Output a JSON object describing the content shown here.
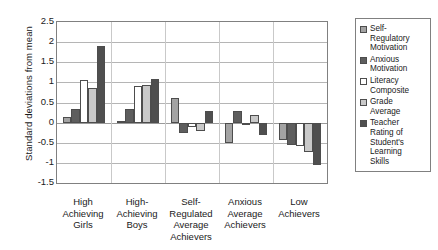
{
  "chart_data": {
    "type": "bar",
    "title": "",
    "xlabel": "",
    "ylabel": "Standard deviations from mean",
    "ylim": [
      -1.5,
      2.5
    ],
    "yticks": [
      2.5,
      2,
      1.5,
      1,
      0.5,
      0,
      -0.5,
      -1,
      -1.5
    ],
    "ytick_labels": [
      "2.5",
      "2",
      "1.5",
      "1",
      "0.5",
      "0",
      "-0.5",
      "-1",
      "-1.5"
    ],
    "grid": true,
    "legend_position": "right",
    "categories": [
      "High Achieving Girls",
      "High-Achieving Boys",
      "Self-Regulated Average Achievers",
      "Anxious Average Achievers",
      "Low Achievers"
    ],
    "category_lines": [
      [
        "High",
        "Achieving",
        "Girls"
      ],
      [
        "High-",
        "Achieving",
        "Boys"
      ],
      [
        "Self-",
        "Regulated",
        "Average",
        "Achievers"
      ],
      [
        "Anxious",
        "Average",
        "Achievers"
      ],
      [
        "Low",
        "Achievers"
      ]
    ],
    "series": [
      {
        "name": "Self-Regulatory Motivation",
        "name_lines": [
          "Self-",
          "Regulatory",
          "Motivation"
        ],
        "color": "#a3a3a3",
        "values": [
          0.13,
          0.05,
          0.6,
          -0.5,
          -0.42
        ]
      },
      {
        "name": "Anxious Motivation",
        "name_lines": [
          "Anxious",
          "Motivation"
        ],
        "color": "#5e5e5e",
        "values": [
          0.35,
          0.35,
          -0.25,
          0.28,
          -0.55
        ]
      },
      {
        "name": "Literacy Composite",
        "name_lines": [
          "Literacy",
          "Composite"
        ],
        "color": "#ffffff",
        "values": [
          1.05,
          0.9,
          -0.12,
          -0.05,
          -0.58
        ]
      },
      {
        "name": "Grade Average",
        "name_lines": [
          "Grade",
          "Average"
        ],
        "color": "#c9c9c9",
        "values": [
          0.87,
          0.93,
          -0.22,
          0.18,
          -0.72
        ]
      },
      {
        "name": "Teacher Rating of Student's Learning Skills",
        "name_lines": [
          "Teacher",
          "Rating of",
          "Student's",
          "Learning",
          "Skills"
        ],
        "color": "#4f4f4f",
        "values": [
          1.9,
          1.08,
          0.3,
          -0.3,
          -1.05
        ]
      }
    ]
  }
}
